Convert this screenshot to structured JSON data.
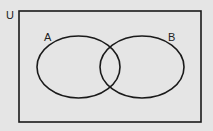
{
  "diagram": {
    "type": "venn",
    "universe": {
      "label": "U",
      "rect": {
        "x": 19,
        "y": 11,
        "width": 182,
        "height": 111
      }
    },
    "sets": [
      {
        "label": "A",
        "cx": 78.5,
        "cy": 67,
        "rx": 41.5,
        "ry": 31,
        "label_x": 44,
        "label_y": 41
      },
      {
        "label": "B",
        "cx": 142,
        "cy": 67,
        "rx": 42,
        "ry": 31,
        "label_x": 168,
        "label_y": 41
      }
    ],
    "colors": {
      "background": "#e5e5e5",
      "stroke": "#1a1a1a"
    }
  }
}
